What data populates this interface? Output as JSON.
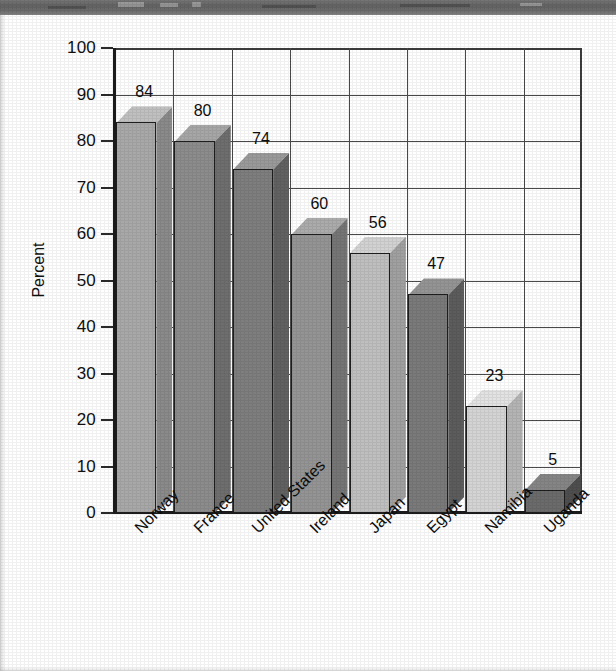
{
  "page": {
    "background_color": "#ffffff",
    "scan_banner_color": "#5f5f5f",
    "axis_color": "#1c1c1c",
    "grid_color": "#4a4a4a"
  },
  "chart_data": {
    "type": "bar",
    "title": "",
    "subtitle": "",
    "xlabel": "",
    "ylabel": "Percent",
    "ylim": [
      0,
      100
    ],
    "ytick_step": 10,
    "ytick_labels": [
      "100",
      "90",
      "80",
      "70",
      "60",
      "50",
      "40",
      "30",
      "20",
      "10",
      "0"
    ],
    "grid": true,
    "legend": "none",
    "style": "3d-block-bars-grayscale",
    "categories": [
      "Norway",
      "France",
      "United States",
      "Ireland",
      "Japan",
      "Egypt",
      "Namibia",
      "Uganda"
    ],
    "values": [
      84,
      80,
      74,
      60,
      56,
      47,
      23,
      5
    ],
    "value_labels": [
      "84",
      "80",
      "74",
      "60",
      "56",
      "47",
      "23",
      "5"
    ],
    "bar_colors": [
      "#a8a8a8",
      "#8c8c8c",
      "#7e7e7e",
      "#949494",
      "#bfbfbf",
      "#7a7a7a",
      "#d4d4d4",
      "#6b6b6b"
    ],
    "bar_top_colors": [
      "#c0c0c0",
      "#a6a6a6",
      "#9a9a9a",
      "#ababab",
      "#d2d2d2",
      "#949494",
      "#e2e2e2",
      "#858585"
    ],
    "bar_side_colors": [
      "#8a8a8a",
      "#6e6e6e",
      "#616161",
      "#757575",
      "#a0a0a0",
      "#5c5c5c",
      "#b4b4b4",
      "#4e4e4e"
    ]
  }
}
